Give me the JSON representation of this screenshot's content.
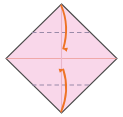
{
  "figure": {
    "title": "Origami valley-fold diagram",
    "caption": "",
    "canvas": {
      "width": 123,
      "height": 117,
      "background": "#ffffff"
    },
    "paper": {
      "name": "square-sheet-rotated-45",
      "shape": "diamond",
      "fill_color": "#f9d7ea",
      "stroke_color": "#4a4a4a",
      "stroke_width": 1,
      "vertices": {
        "top": {
          "x": 61.5,
          "y": 4
        },
        "right": {
          "x": 117,
          "y": 58.5
        },
        "bottom": {
          "x": 61.5,
          "y": 113
        },
        "left": {
          "x": 6,
          "y": 58.5
        }
      }
    },
    "creases": [
      {
        "name": "horizontal-center-crease",
        "style": "solid",
        "color": "#f0a8a8",
        "orientation": "horizontal",
        "x1": 6,
        "y1": 58.5,
        "x2": 117,
        "y2": 58.5
      },
      {
        "name": "vertical-center-crease",
        "style": "solid",
        "color": "#e8b8c8",
        "orientation": "vertical",
        "x1": 61.5,
        "y1": 4,
        "x2": 61.5,
        "y2": 113
      },
      {
        "name": "upper-valley-fold-line",
        "style": "dashed",
        "color": "#9a8aa8",
        "orientation": "horizontal",
        "x1": 32,
        "y1": 32.5,
        "x2": 91,
        "y2": 32.5
      },
      {
        "name": "lower-valley-fold-line",
        "style": "dashed",
        "color": "#9a8aa8",
        "orientation": "horizontal",
        "x1": 32,
        "y1": 85,
        "x2": 91,
        "y2": 85
      }
    ],
    "arrows": [
      {
        "name": "fold-down-arrow",
        "color": "#ee7326",
        "direction": "down",
        "from": {
          "x": 61.5,
          "y": 5
        },
        "to": {
          "x": 62,
          "y": 57
        },
        "label": ""
      },
      {
        "name": "fold-up-arrow",
        "color": "#ee7326",
        "direction": "up",
        "from": {
          "x": 61.5,
          "y": 112
        },
        "to": {
          "x": 62,
          "y": 61
        },
        "label": ""
      }
    ]
  }
}
